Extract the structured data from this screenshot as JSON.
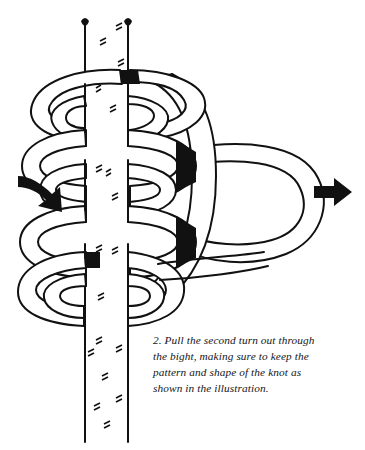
{
  "figure": {
    "name": "knot-tying-step-illustration",
    "background_color": "#ffffff",
    "line_color": "#111111",
    "fill_color": "#ffffff",
    "shadow_color": "#000000",
    "line_width": 2.0,
    "elements": {
      "standing_line_label": "vertical standing rope",
      "coils_label": "horizontal wrapping turns",
      "bight_label": "bight loop pulled to the right",
      "left_arrow_label": "curved arrow pointing in at left",
      "right_arrow_label": "straight arrow pointing out at right"
    }
  },
  "caption": {
    "step_number": "2.",
    "full_text": "2. Pull the second turn out through the bight, making sure to keep the pattern and shape of the knot as shown in the illustration.",
    "lines": [
      "2. Pull the second turn out through",
      "the bight, making sure to keep the",
      "pattern and shape of the knot as",
      "shown in the illustration."
    ]
  }
}
